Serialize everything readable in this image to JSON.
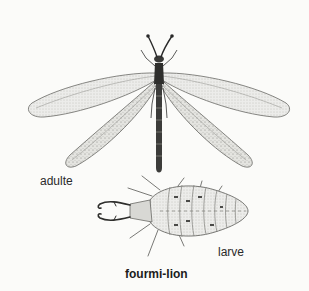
{
  "illustration": {
    "title": "fourmi-lion",
    "labels": {
      "adult": "adulte",
      "larva": "larve"
    },
    "subjects": [
      {
        "name": "adult antlion",
        "depiction": "dragonfly-like insect with four long veined wings, slender segmented abdomen, clubbed antennae"
      },
      {
        "name": "antlion larva",
        "depiction": "oval bristly segmented body with large curved pincer mandibles"
      }
    ],
    "colors": {
      "background": "#fbfbf9",
      "ink": "#2a2a2a",
      "wing_fill": "#e6e6e2"
    }
  }
}
